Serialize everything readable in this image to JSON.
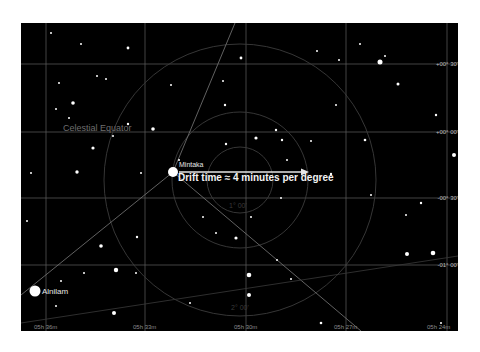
{
  "chart": {
    "background": "#000000",
    "grid_color": "#6a6a6a",
    "circle_color": "#3a3a3a",
    "dec_labels": [
      "+00° 30'",
      "+00° 00'",
      "-00° 30'",
      "-01° 00'"
    ],
    "ra_labels": [
      "05h 36m",
      "05h 33m",
      "05h 30m",
      "05h 27m",
      "05h 24m"
    ],
    "celestial_equator_label": "Celestial Equator",
    "stars": {
      "mintaka": "Mintaka",
      "alnilam": "Alnilam"
    },
    "annotation": "Drift time ≈ 4 minutes per degree",
    "circle_labels": [
      "1° 00'",
      "2° 00'"
    ]
  }
}
